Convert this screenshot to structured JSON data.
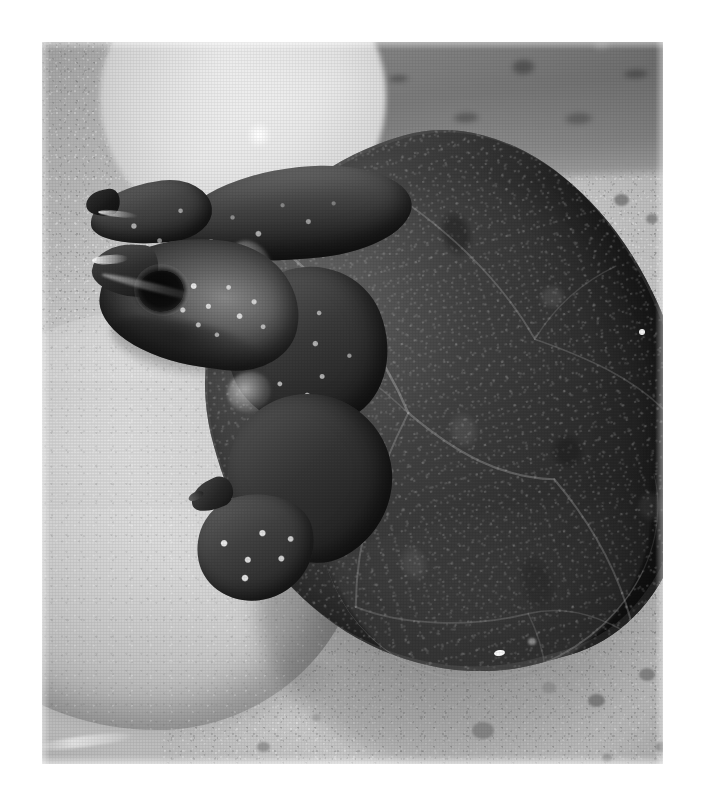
{
  "page": {
    "background_color": "#ffffff",
    "width": 701,
    "height": 805
  },
  "photograph": {
    "alt_text": "Black and white photograph of a two-headed turtle resting on pale rocks and sand",
    "subject": "two-headed turtle",
    "medium": "grayscale photograph",
    "frame": {
      "left": 42,
      "top": 42,
      "width": 621,
      "height": 722
    },
    "palette": {
      "sand_light": "#cfcdc9",
      "sand_mid": "#b9b7b3",
      "rock_light": "#e2e0dc",
      "shell_dark": "#1e1c1a",
      "shell_mid": "#474442",
      "skin_light_spot": "#f6f4f0",
      "background_band": "#7d7a77",
      "highlight_white": "#ffffff"
    },
    "regions": [
      {
        "name": "background-blurred-band",
        "description": "out-of-focus dark gravel band across the upper right"
      },
      {
        "name": "background-pale-egg-stone",
        "description": "large pale out-of-focus rounded stone at upper left"
      },
      {
        "name": "background-white-reflection",
        "description": "bright white bar and pale dots at upper middle right"
      },
      {
        "name": "foreground-pale-rock",
        "description": "large smooth pale rock occupying the lower left"
      },
      {
        "name": "sand-substrate",
        "description": "fine speckled sand and gravel filling the frame"
      },
      {
        "name": "turtle-carapace",
        "description": "dark domed shell with visible scute seams and mottled texture"
      },
      {
        "name": "turtle-head-upper",
        "description": "second head and neck raised above and behind the main head"
      },
      {
        "name": "turtle-head-main",
        "description": "lower foreground head with dark round eye and pale speckled cheek"
      },
      {
        "name": "turtle-front-leg",
        "description": "front limb with speckled foot and claws resting on the rock"
      }
    ],
    "pebbles": [
      {
        "x": 430,
        "y": 680,
        "w": 22,
        "h": 17,
        "shade": "#8e8b87"
      },
      {
        "x": 500,
        "y": 640,
        "w": 14,
        "h": 11,
        "shade": "#9a9793"
      },
      {
        "x": 546,
        "y": 652,
        "w": 17,
        "h": 13,
        "shade": "#8a8783"
      },
      {
        "x": 597,
        "y": 626,
        "w": 16,
        "h": 13,
        "shade": "#92908c"
      },
      {
        "x": 560,
        "y": 712,
        "w": 10,
        "h": 8,
        "shade": "#a5a29e"
      },
      {
        "x": 614,
        "y": 700,
        "w": 13,
        "h": 10,
        "shade": "#98958f"
      },
      {
        "x": 572,
        "y": 152,
        "w": 15,
        "h": 12,
        "shade": "#8c8985"
      },
      {
        "x": 604,
        "y": 172,
        "w": 12,
        "h": 10,
        "shade": "#949189"
      },
      {
        "x": 630,
        "y": 198,
        "w": 11,
        "h": 9,
        "shade": "#9a9793"
      },
      {
        "x": 215,
        "y": 700,
        "w": 13,
        "h": 10,
        "shade": "#a09d99"
      },
      {
        "x": 270,
        "y": 672,
        "w": 9,
        "h": 7,
        "shade": "#a8a5a1"
      },
      {
        "x": 486,
        "y": 596,
        "w": 8,
        "h": 7,
        "shade": "#8f8c88"
      }
    ],
    "scute_seams": [
      {
        "d": "M 96 44 C 150 110, 186 186, 196 268",
        "w": 2.4,
        "o": 0.55
      },
      {
        "d": "M 196 268 C 232 322, 268 356, 318 372",
        "w": 2.2,
        "o": 0.48
      },
      {
        "d": "M 196 268 C 150 318, 112 372, 92 440",
        "w": 2.0,
        "o": 0.42
      },
      {
        "d": "M 318 372 C 346 434, 356 490, 352 546",
        "w": 2.0,
        "o": 0.45
      },
      {
        "d": "M 92 440 C 130 470, 196 492, 256 494",
        "w": 1.8,
        "o": 0.38
      },
      {
        "d": "M 256 494 C 300 496, 330 522, 352 546",
        "w": 1.6,
        "o": 0.34
      },
      {
        "d": "M 214 22 C 268 78, 318 150, 338 232",
        "w": 1.8,
        "o": 0.4
      },
      {
        "d": "M 338 232 C 386 266, 420 296, 442 334",
        "w": 1.6,
        "o": 0.34
      },
      {
        "d": "M 66 126 C 120 158, 162 212, 196 268",
        "w": 1.5,
        "o": 0.3
      },
      {
        "d": "M 352 546 C 392 566, 430 572, 462 566",
        "w": 1.6,
        "o": 0.32
      },
      {
        "d": "M 256 494 C 262 528, 260 556, 248 584",
        "w": 1.5,
        "o": 0.3
      },
      {
        "d": "M 338 232 C 366 206, 400 190, 436 184",
        "w": 1.4,
        "o": 0.28
      }
    ]
  }
}
